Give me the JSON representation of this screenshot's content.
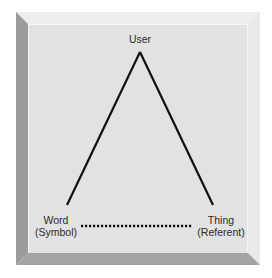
{
  "diagram": {
    "type": "semiotic-triangle",
    "nodes": {
      "top": {
        "lines": [
          "User"
        ]
      },
      "left": {
        "lines": [
          "Word",
          "(Symbol)"
        ]
      },
      "right": {
        "lines": [
          "Thing",
          "(Referent)"
        ]
      }
    },
    "edges": [
      {
        "from": "left",
        "to": "top",
        "style": "solid"
      },
      {
        "from": "top",
        "to": "right",
        "style": "solid"
      },
      {
        "from": "left",
        "to": "right",
        "style": "dotted"
      }
    ]
  },
  "colors": {
    "face": "#e2e2e2",
    "bevel_top": "#ededed",
    "bevel_right": "#e9e9e9",
    "bevel_left": "#9c9c9c",
    "bevel_bottom": "#a3a3a3",
    "line": "#111111",
    "text": "#2a2a2a"
  }
}
